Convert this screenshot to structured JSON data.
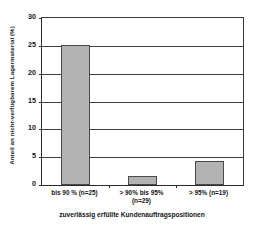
{
  "chart_data": {
    "type": "bar",
    "title": "",
    "subtitle": "",
    "categories": [
      "bis 90 % (n=25)",
      "> 90% bis 95%\n(n=29)",
      "> 95% (n=19)"
    ],
    "category_lines": [
      [
        "bis 90 % (n=25)"
      ],
      [
        "> 90% bis 95%",
        "(n=29)"
      ],
      [
        "> 95% (n=19)"
      ]
    ],
    "values": [
      25.1,
      1.7,
      4.3
    ],
    "xlabel": "zuverlässig erfüllte Kundenauftragspositionen",
    "ylabel": "Anteil an nicht-verfügbarem Lagermaterial (%)",
    "ylim": [
      0,
      30
    ],
    "ytick_labels": [
      "0",
      "5",
      "10",
      "15",
      "20",
      "25",
      "30"
    ],
    "ytick_values": [
      0,
      5,
      10,
      15,
      20,
      25,
      30
    ],
    "grid": "horizontal",
    "legend": "none",
    "bar_color": "#b2b2b2",
    "bar_edge_color": "#4a4a4a",
    "axis_color": "#2a2a2a",
    "grid_color": "#3c3c3c",
    "background_color": "#ffffff"
  }
}
